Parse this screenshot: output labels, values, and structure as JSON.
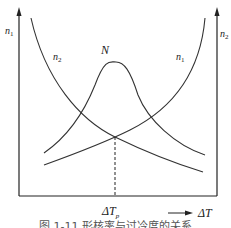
{
  "diagram": {
    "left_axis_label": "n",
    "left_axis_sub": "1",
    "right_axis_label": "n",
    "right_axis_sub": "2",
    "curve_labels": [
      {
        "id": "n2-left",
        "text": "n",
        "sub": "2"
      },
      {
        "id": "N-peak",
        "text": "N",
        "sub": ""
      },
      {
        "id": "n1-right",
        "text": "n",
        "sub": "1"
      }
    ],
    "x_marker_label": "ΔT",
    "x_marker_sub": "p",
    "x_axis_label": "ΔT",
    "caption": "图 1-11  形核率与过冷度的关系"
  }
}
